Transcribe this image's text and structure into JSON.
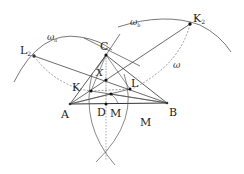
{
  "figure": {
    "points": {
      "A": {
        "label": "A",
        "x": 70,
        "y": 104
      },
      "B": {
        "label": "B",
        "x": 167,
        "y": 103
      },
      "C": {
        "label": "C",
        "x": 106,
        "y": 55
      },
      "K": {
        "label": "K",
        "x": 91,
        "y": 91
      },
      "L": {
        "label": "L",
        "x": 130,
        "y": 89
      },
      "X": {
        "label": "X",
        "x": 106,
        "y": 80
      },
      "D": {
        "label": "D",
        "x": 106,
        "y": 104
      },
      "M": {
        "label": "M",
        "x": 111,
        "y": 94
      },
      "K2": {
        "label": "K",
        "sub": "2",
        "x": 190,
        "y": 24
      },
      "L2": {
        "label": "L",
        "sub": "2",
        "x": 34,
        "y": 56
      }
    },
    "circle_labels": {
      "omega_a": {
        "label": "ω",
        "sub": "a"
      },
      "omega_b": {
        "label": "ω",
        "sub": "b"
      },
      "omega": {
        "label": "ω"
      }
    },
    "region_label": "M",
    "colors": {
      "stroke": "#444444",
      "point": "#111111",
      "dashed": "#777777"
    }
  }
}
